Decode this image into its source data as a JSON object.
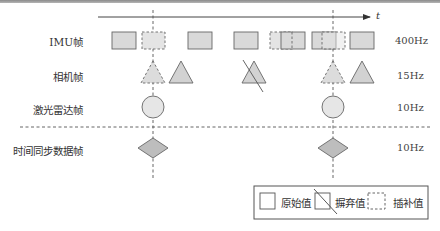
{
  "axis": {
    "time_label": "t"
  },
  "rows": [
    {
      "label": "IMU帧",
      "frequency": "400Hz"
    },
    {
      "label": "相机帧",
      "frequency": "15Hz"
    },
    {
      "label": "激光雷达帧",
      "frequency": "10Hz"
    },
    {
      "label": "时间同步数据帧",
      "frequency": "10Hz"
    }
  ],
  "legend": {
    "original": "原始值",
    "discarded": "摒弃值",
    "interpolated": "插补值"
  },
  "colors": {
    "shape_fill": "#d9d9d9",
    "diamond_fill": "#bdbdbd",
    "stroke": "#555555",
    "dashed": "#555555"
  }
}
